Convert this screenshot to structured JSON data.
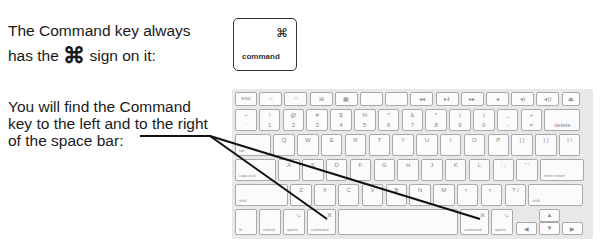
{
  "intro": {
    "line1": "The Command key always",
    "line2_pre": "has the",
    "line2_symbol": "⌘",
    "line2_post": "sign on it:"
  },
  "command_key": {
    "symbol": "⌘",
    "label": "command"
  },
  "location": {
    "line1": "You will find the Command",
    "line2": "key to the left and to the right",
    "line3": "of the space bar:"
  },
  "keyboard": {
    "fn_row": [
      "esc",
      "☼",
      "☼",
      "⊞",
      "▦",
      "",
      "",
      "◂◂",
      "▸‖",
      "▸▸",
      "◂",
      "◂)",
      "◂))",
      "⏏"
    ],
    "num_row": [
      {
        "t": "~",
        "b": "`"
      },
      {
        "t": "!",
        "b": "1"
      },
      {
        "t": "@",
        "b": "2"
      },
      {
        "t": "#",
        "b": "3"
      },
      {
        "t": "$",
        "b": "4"
      },
      {
        "t": "%",
        "b": "5"
      },
      {
        "t": "^",
        "b": "6"
      },
      {
        "t": "&",
        "b": "7"
      },
      {
        "t": "*",
        "b": "8"
      },
      {
        "t": "(",
        "b": "9"
      },
      {
        "t": ")",
        "b": "0"
      },
      {
        "t": "_",
        "b": "-"
      },
      {
        "t": "+",
        "b": "="
      },
      {
        "t": "",
        "b": "delete"
      }
    ],
    "tab_row": [
      "tab",
      "Q",
      "W",
      "E",
      "R",
      "T",
      "Y",
      "U",
      "I",
      "O",
      "P",
      "{ [",
      "} ]",
      "| \\"
    ],
    "caps_row": [
      "caps lock",
      "A",
      "S",
      "D",
      "F",
      "G",
      "H",
      "J",
      "K",
      "L",
      ": ;",
      "\" '",
      "enter return"
    ],
    "shift_row": [
      "shift",
      "Z",
      "X",
      "C",
      "V",
      "B",
      "N",
      "M",
      "< ,",
      "> .",
      "? /",
      "shift"
    ],
    "bottom_row": [
      "fn",
      "control",
      "option",
      "command",
      "",
      "command",
      "option"
    ],
    "command_symbol": "⌘",
    "option_symbol": "⌥",
    "arrows": [
      "▲",
      "◀",
      "▼",
      "▶"
    ]
  }
}
